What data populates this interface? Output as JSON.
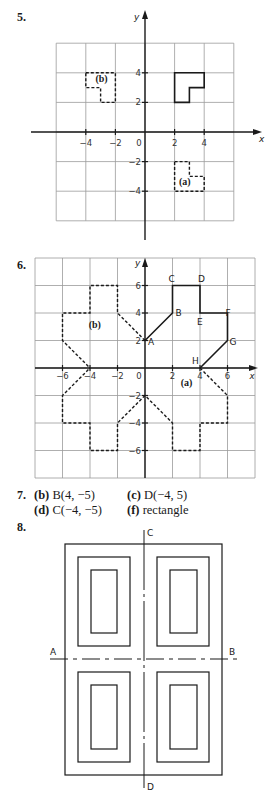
{
  "questions": [
    {
      "number": "5."
    },
    {
      "number": "6."
    },
    {
      "number": "7."
    },
    {
      "number": "8."
    }
  ],
  "q5": {
    "axis_labels": {
      "x": "x",
      "y": "y"
    },
    "x_ticks": [
      "−4",
      "−2",
      "0",
      "2",
      "4"
    ],
    "y_ticks": [
      "4",
      "2",
      "−2",
      "−4"
    ],
    "shapes": {
      "original": [
        [
          2,
          2
        ],
        [
          2,
          4
        ],
        [
          4,
          4
        ],
        [
          4,
          3
        ],
        [
          3,
          3
        ],
        [
          3,
          2
        ]
      ],
      "a": [
        [
          2,
          -2
        ],
        [
          3,
          -2
        ],
        [
          3,
          -3
        ],
        [
          4,
          -3
        ],
        [
          4,
          -4
        ],
        [
          2,
          -4
        ]
      ],
      "b": [
        [
          -4,
          4
        ],
        [
          -2,
          4
        ],
        [
          -2,
          2
        ],
        [
          -3,
          2
        ],
        [
          -3,
          3
        ],
        [
          -4,
          3
        ]
      ]
    },
    "labels": {
      "a": "(a)",
      "b": "(b)"
    }
  },
  "q6": {
    "axis_labels": {
      "x": "x",
      "y": "y"
    },
    "x_ticks": [
      "−6",
      "−4",
      "−2",
      "0",
      "2",
      "4",
      "6"
    ],
    "y_ticks": [
      "6",
      "4",
      "2",
      "−2",
      "−4",
      "−6"
    ],
    "points": {
      "A": [
        0,
        2
      ],
      "B": [
        2,
        4
      ],
      "C": [
        2,
        6
      ],
      "D": [
        4,
        6
      ],
      "E": [
        4,
        4
      ],
      "F": [
        6,
        4
      ],
      "G": [
        6,
        2
      ],
      "H": [
        4,
        0
      ]
    },
    "point_labels": [
      "A",
      "B",
      "C",
      "D",
      "E",
      "F",
      "G",
      "H"
    ],
    "labels": {
      "a": "(a)",
      "b": "(b)"
    }
  },
  "q7": {
    "answers": [
      {
        "part": "(b)",
        "text": "B(4, −5)"
      },
      {
        "part": "(c)",
        "text": "D(−4, 5)"
      },
      {
        "part": "(d)",
        "text": "C(−4, −5)"
      },
      {
        "part": "(f)",
        "text": "rectangle"
      }
    ]
  },
  "q8": {
    "labels": {
      "A": "A",
      "B": "B",
      "C": "C",
      "D": "D"
    }
  }
}
